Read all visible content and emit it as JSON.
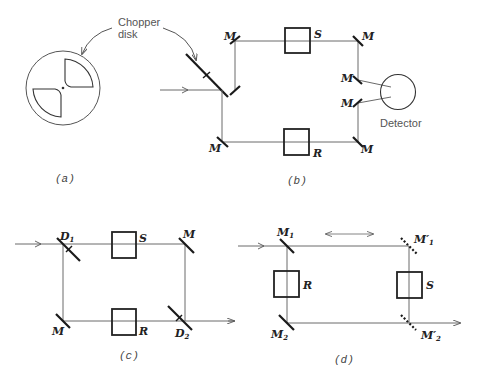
{
  "figure": {
    "panels": [
      {
        "id": "a",
        "caption": "(a)",
        "annotation": {
          "line1": "Chopper",
          "line2": "disk"
        },
        "elements": [
          "chopper-disk"
        ]
      },
      {
        "id": "b",
        "caption": "(b)",
        "labels": {
          "mirror": "M",
          "sample": "S",
          "reference": "R",
          "detector": "Detector"
        }
      },
      {
        "id": "c",
        "caption": "(c)",
        "labels": {
          "splitter1": "D",
          "splitter1_sub": "1",
          "splitter2": "D",
          "splitter2_sub": "2",
          "mirror": "M",
          "sample": "S",
          "reference": "R"
        }
      },
      {
        "id": "d",
        "caption": "(d)",
        "labels": {
          "m1": "M",
          "m1_sub": "1",
          "m2": "M",
          "m2_sub": "2",
          "m1p": "M′",
          "m1p_sub": "1",
          "m2p": "M′",
          "m2p_sub": "2",
          "sample": "S",
          "reference": "R"
        }
      }
    ],
    "colors": {
      "line": "#1a1a1a",
      "beam": "#6a6a6a",
      "text": "#222222",
      "background": "#ffffff"
    }
  }
}
